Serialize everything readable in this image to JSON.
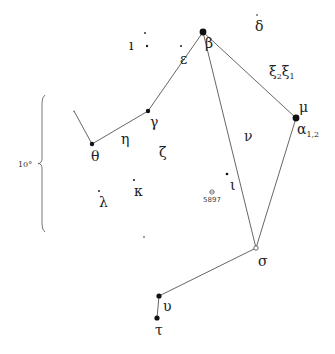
{
  "chart_data": {
    "type": "diagram",
    "title": "",
    "scale": {
      "label": "10°",
      "y_top": 95,
      "y_bottom": 232,
      "x": 42
    },
    "stars": [
      {
        "id": "beta",
        "label": "β",
        "x": 203,
        "y": 32,
        "r": 3.4,
        "label_x": 205,
        "label_y": 48
      },
      {
        "id": "alpha12",
        "label": "α",
        "sub": "1,2",
        "x": 296,
        "y": 118,
        "r": 3.4,
        "label_x": 297,
        "label_y": 134
      },
      {
        "id": "mu",
        "label": "μ",
        "x": 0,
        "y": 0,
        "r": 0,
        "label_x": 299,
        "label_y": 112
      },
      {
        "id": "gamma",
        "label": "γ",
        "x": 148,
        "y": 111,
        "r": 2.2,
        "label_x": 150,
        "label_y": 127
      },
      {
        "id": "epsilon",
        "label": "ε",
        "x": 0,
        "y": 0,
        "r": 0,
        "label_x": 180,
        "label_y": 64
      },
      {
        "id": "theta",
        "label": "θ",
        "x": 92,
        "y": 144,
        "r": 2.2,
        "label_x": 91,
        "label_y": 161
      },
      {
        "id": "eta",
        "label": "η",
        "x": 0,
        "y": 0,
        "r": 0,
        "label_x": 121,
        "label_y": 144
      },
      {
        "id": "zeta",
        "label": "ζ",
        "x": 0,
        "y": 0,
        "r": 0,
        "label_x": 159,
        "label_y": 157
      },
      {
        "id": "nu",
        "label": "ν",
        "x": 0,
        "y": 0,
        "r": 0,
        "label_x": 244,
        "label_y": 141
      },
      {
        "id": "delta",
        "label": "δ",
        "x": 257,
        "y": 15,
        "r": 0.8,
        "label_x": 255,
        "label_y": 31
      },
      {
        "id": "xi",
        "label": "ξ",
        "x": 0,
        "y": 0,
        "r": 0,
        "label_x": 270,
        "label_y": 77
      },
      {
        "id": "iota",
        "label": "ι",
        "x": 227,
        "y": 174,
        "r": 1.3,
        "label_x": 230,
        "label_y": 190
      },
      {
        "id": "kappa",
        "label": "κ",
        "x": 134,
        "y": 180,
        "r": 1.0,
        "label_x": 134,
        "label_y": 196
      },
      {
        "id": "lambda",
        "label": "λ",
        "x": 99,
        "y": 191,
        "r": 0.9,
        "label_x": 99,
        "label_y": 207
      },
      {
        "id": "sigma",
        "label": "σ",
        "x": 256,
        "y": 248,
        "r": 2.2,
        "open": true,
        "label_x": 258,
        "label_y": 266
      },
      {
        "id": "upsilon",
        "label": "υ",
        "x": 159,
        "y": 296,
        "r": 2.6,
        "label_x": 163,
        "label_y": 311
      },
      {
        "id": "tau",
        "label": "τ",
        "x": 157,
        "y": 318,
        "r": 2.6,
        "label_x": 155,
        "label_y": 335
      }
    ],
    "xi_label": {
      "parts": [
        "ξ",
        "2",
        "ξ",
        "1"
      ],
      "x": 269,
      "y": 76
    },
    "minor_stars": [
      {
        "x": 145,
        "y": 33,
        "r": 0.9
      },
      {
        "x": 147,
        "y": 46,
        "r": 1.2
      },
      {
        "x": 181,
        "y": 46,
        "r": 1.0
      },
      {
        "x": 144,
        "y": 237,
        "r": 0.8
      },
      {
        "x": 74,
        "y": 111,
        "r": 0.6
      }
    ],
    "faint_label": {
      "text": "ı",
      "x": 129,
      "y": 50
    },
    "cluster": {
      "label": "5897",
      "x": 212,
      "y": 192,
      "label_x": 212,
      "label_y": 202
    },
    "lines": [
      [
        [
          74,
          111
        ],
        [
          92,
          144
        ],
        [
          148,
          111
        ],
        [
          203,
          32
        ]
      ],
      [
        [
          203,
          32
        ],
        [
          296,
          118
        ],
        [
          256,
          248
        ],
        [
          203,
          32
        ]
      ],
      [
        [
          256,
          248
        ],
        [
          159,
          296
        ],
        [
          157,
          318
        ]
      ]
    ]
  }
}
